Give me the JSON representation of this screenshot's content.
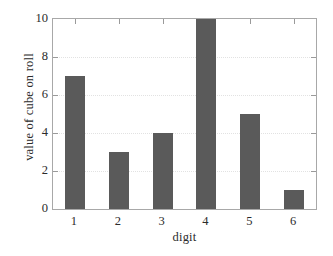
{
  "chart_data": {
    "type": "bar",
    "title": "",
    "subtitle": "",
    "xlabel": "digit",
    "ylabel": "value of cube on roll",
    "categories": [
      "1",
      "2",
      "3",
      "4",
      "5",
      "6"
    ],
    "values": [
      7,
      3,
      4,
      10,
      5,
      1
    ],
    "series": [
      {
        "name": "value of cube on roll",
        "values": [
          7,
          3,
          4,
          10,
          5,
          1
        ]
      }
    ],
    "ylim": [
      0,
      10
    ],
    "yticks": [
      0,
      2,
      4,
      6,
      8,
      10
    ],
    "ytick_labels": [
      "0",
      "2",
      "4",
      "6",
      "8",
      "10"
    ],
    "xtick_labels": [
      "1",
      "2",
      "3",
      "4",
      "5",
      "6"
    ],
    "grid": true,
    "grid_axis": "y",
    "legend": null,
    "legend_position": "none",
    "annotations": [],
    "colors": {
      "bar": "#5a5a5a",
      "background": "#ffffff",
      "axis": "#a8a8a8",
      "grid": "#e2e2e2",
      "text": "#2b2b2b"
    }
  }
}
